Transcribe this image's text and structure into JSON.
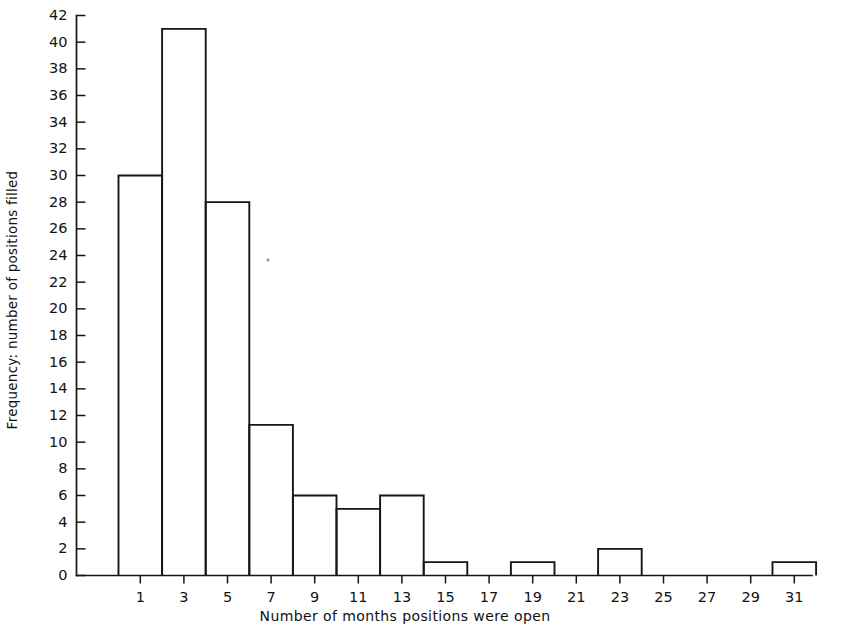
{
  "chart_data": {
    "type": "bar",
    "title": "",
    "subtitle": "",
    "xlabel": "Number of months positions were open",
    "ylabel": "Frequency: number of positions filled",
    "categories": [
      "1",
      "3",
      "5",
      "7",
      "9",
      "11",
      "13",
      "15",
      "17",
      "19",
      "21",
      "23",
      "25",
      "27",
      "29",
      "31"
    ],
    "values": [
      30,
      41,
      28,
      11.3,
      6,
      5,
      6,
      1,
      0,
      1,
      0,
      2,
      0,
      0,
      0,
      1
    ],
    "xlim": [
      0,
      32
    ],
    "ylim": [
      0,
      42
    ],
    "ytick_labels": [
      "0",
      "2",
      "4",
      "6",
      "8",
      "10",
      "12",
      "14",
      "16",
      "18",
      "20",
      "22",
      "24",
      "26",
      "28",
      "30",
      "32",
      "34",
      "36",
      "38",
      "40",
      "42"
    ],
    "ytick_values": [
      0,
      2,
      4,
      6,
      8,
      10,
      12,
      14,
      16,
      18,
      20,
      22,
      24,
      26,
      28,
      30,
      32,
      34,
      36,
      38,
      40,
      42
    ],
    "xtick_labels": [
      "1",
      "3",
      "5",
      "7",
      "9",
      "11",
      "13",
      "15",
      "17",
      "19",
      "21",
      "23",
      "25",
      "27",
      "29",
      "31"
    ],
    "xtick_values": [
      1,
      3,
      5,
      7,
      9,
      11,
      13,
      15,
      17,
      19,
      21,
      23,
      25,
      27,
      29,
      31
    ],
    "bin_width": 2,
    "grid": false,
    "legend": false,
    "legend_position": "none",
    "bar_style": "outline",
    "bar_fill_color": "#ffffff",
    "bar_edge_color": "#161616",
    "axis_color": "#161616",
    "background_color": "#ffffff"
  },
  "figure": {
    "y_axis_title": "Frequency: number of positions filled",
    "x_axis_title": "Number of months positions were open"
  }
}
